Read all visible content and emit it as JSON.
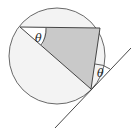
{
  "diagram": {
    "type": "geometry",
    "labels": {
      "angle_at_left": "θ",
      "angle_at_tangent": "θ"
    },
    "colors": {
      "stroke": "#333333",
      "circle_fill": "#f2f2f2",
      "triangle_fill": "#c8c8c8",
      "background": "#ffffff"
    }
  }
}
